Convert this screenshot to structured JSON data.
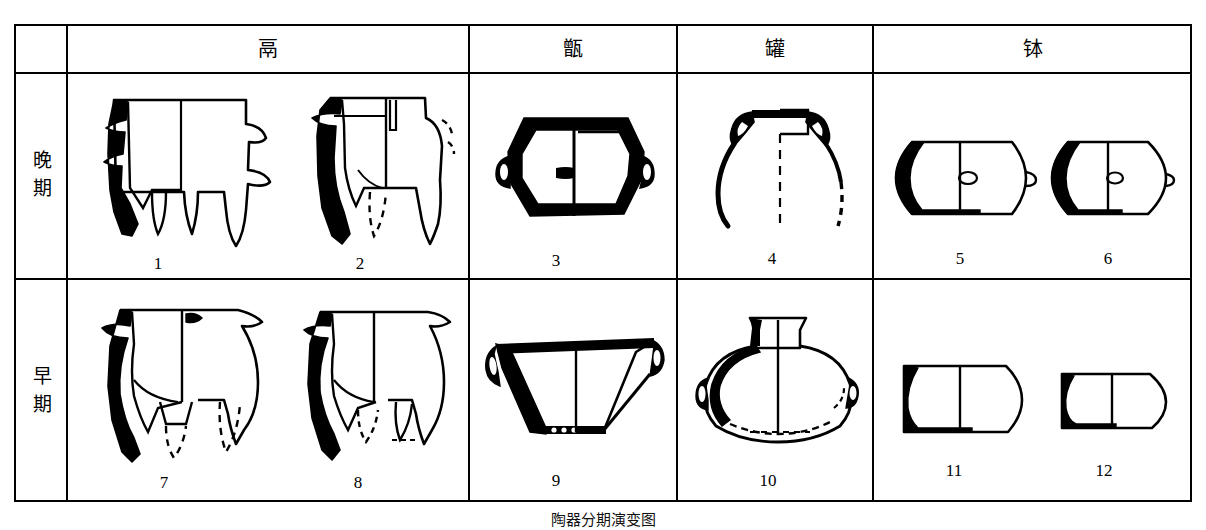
{
  "figure": {
    "caption": "陶器分期演变图",
    "width": 1206,
    "height": 530,
    "ink_color": "#000000",
    "background": "#ffffff"
  },
  "table": {
    "corner_label": "",
    "column_headers": [
      {
        "id": "li",
        "label": "鬲",
        "meaning": "tripod cauldron"
      },
      {
        "id": "zeng",
        "label": "甑",
        "meaning": "steamer"
      },
      {
        "id": "guan",
        "label": "罐",
        "meaning": "jar"
      },
      {
        "id": "bo",
        "label": "钵",
        "meaning": "bowl"
      }
    ],
    "row_headers": [
      {
        "id": "late",
        "chars": [
          "晚",
          "期"
        ],
        "label": "晚期",
        "meaning": "late period"
      },
      {
        "id": "early",
        "chars": [
          "早",
          "期"
        ],
        "label": "早期",
        "meaning": "early period"
      }
    ]
  },
  "artifacts": [
    {
      "num": "1",
      "row": "late",
      "column": "li",
      "desc": "flat-shouldered li with three hollow legs, sectioned left half solid black"
    },
    {
      "num": "2",
      "row": "late",
      "column": "li",
      "desc": "li with everted rim, dashed reconstruction of missing leg"
    },
    {
      "num": "3",
      "row": "late",
      "column": "zeng",
      "desc": "angular zeng steamer with two lug handles, heavy black walls"
    },
    {
      "num": "4",
      "row": "late",
      "column": "guan",
      "desc": "fragmentary jar, square mouth with shoulder loop handles, dashed profile"
    },
    {
      "num": "5",
      "row": "late",
      "column": "bo",
      "desc": "deep bowl with small lug knob, hatched section wall"
    },
    {
      "num": "6",
      "row": "late",
      "column": "bo",
      "desc": "rounded bowl with small lug knob"
    },
    {
      "num": "7",
      "row": "early",
      "column": "li",
      "desc": "round-bodied li, dashed legs, small shoulder lug"
    },
    {
      "num": "8",
      "row": "early",
      "column": "li",
      "desc": "round-bodied li with dashed foot outlines"
    },
    {
      "num": "9",
      "row": "early",
      "column": "zeng",
      "desc": "basin-shaped zeng with pierced base and two lug handles"
    },
    {
      "num": "10",
      "row": "early",
      "column": "guan",
      "desc": "globular jar with flaring neck and two side lugs, dashed base"
    },
    {
      "num": "11",
      "row": "early",
      "column": "bo",
      "desc": "straight-walled bowl with thick black sectioned wall"
    },
    {
      "num": "12",
      "row": "early",
      "column": "bo",
      "desc": "small shallow bowl with black sectioned wall"
    }
  ]
}
